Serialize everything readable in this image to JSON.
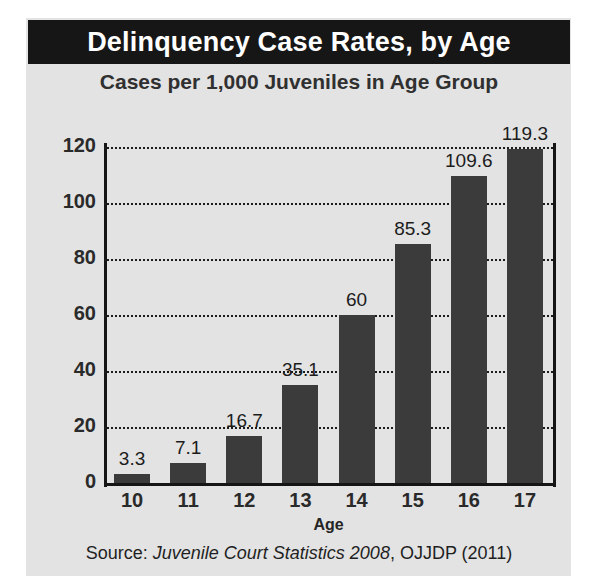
{
  "title": "Delinquency Case Rates, by Age",
  "subtitle": "Cases per 1,000 Juveniles in Age Group",
  "source": {
    "prefix": "Source: ",
    "italic": "Juvenile Court Statistics 2008",
    "suffix": ", OJJDP (2011)"
  },
  "colors": {
    "title_band": "#161616",
    "panel": "#e3e3e3",
    "bar": "#3b3b3b",
    "axis": "#151515",
    "text": "#1f1f1f"
  },
  "chart_data": {
    "type": "bar",
    "title": "Delinquency Case Rates, by Age",
    "subtitle": "Cases per 1,000 Juveniles in Age Group",
    "xlabel": "Age",
    "ylabel": "",
    "categories": [
      "10",
      "11",
      "12",
      "13",
      "14",
      "15",
      "16",
      "17"
    ],
    "values": [
      3.3,
      7.1,
      16.7,
      35.1,
      60,
      85.3,
      109.6,
      119.3
    ],
    "value_labels": [
      "3.3",
      "7.1",
      "16.7",
      "35.1",
      "60",
      "85.3",
      "109.6",
      "119.3"
    ],
    "ylim": [
      0,
      120
    ],
    "yticks": [
      0,
      20,
      40,
      60,
      80,
      100,
      120
    ],
    "ytick_labels": [
      "0",
      "20",
      "40",
      "60",
      "80",
      "100",
      "120"
    ],
    "grid": true,
    "grid_style": "dotted-horizontal",
    "legend": false,
    "source": "Source: Juvenile Court Statistics 2008, OJJDP (2011)"
  }
}
